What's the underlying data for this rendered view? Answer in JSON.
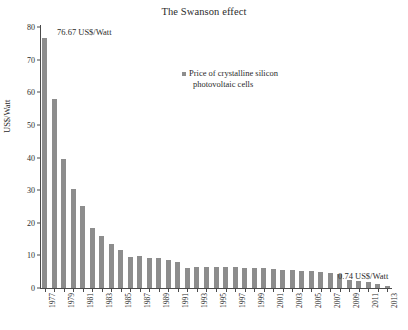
{
  "chart_data": {
    "type": "bar",
    "title": "The Swanson effect",
    "xlabel": "",
    "ylabel": "US$/Watt",
    "ylim": [
      0,
      80
    ],
    "ytick_step": 10,
    "yticks": [
      0,
      10,
      20,
      30,
      40,
      50,
      60,
      70,
      80
    ],
    "grid": false,
    "legend_position": "upper-center",
    "series_name": "Price of crystalline silicon photovoltaic cells",
    "legend_line_1": "Price of crystalline silicon",
    "legend_line_2": "photovoltaic cells",
    "bar_color": "#8d8d8d",
    "axis_color": "#4a4a4a",
    "categories": [
      "1977",
      "1978",
      "1979",
      "1980",
      "1981",
      "1982",
      "1983",
      "1984",
      "1985",
      "1986",
      "1987",
      "1988",
      "1989",
      "1990",
      "1991",
      "1992",
      "1993",
      "1994",
      "1995",
      "1996",
      "1997",
      "1998",
      "1999",
      "2000",
      "2001",
      "2002",
      "2003",
      "2004",
      "2005",
      "2006",
      "2007",
      "2008",
      "2009",
      "2010",
      "2011",
      "2012",
      "2013"
    ],
    "tick_labels": [
      "1977",
      "",
      "1979",
      "",
      "1981",
      "",
      "1983",
      "",
      "1985",
      "",
      "1987",
      "",
      "1989",
      "",
      "1991",
      "",
      "1993",
      "",
      "1995",
      "",
      "1997",
      "",
      "1999",
      "",
      "2001",
      "",
      "2003",
      "",
      "2005",
      "",
      "2007",
      "",
      "2009",
      "",
      "2011",
      "",
      "2013"
    ],
    "values": [
      76.67,
      58.0,
      39.5,
      30.5,
      25.0,
      18.5,
      16.0,
      13.5,
      11.5,
      9.5,
      9.7,
      9.2,
      9.1,
      8.5,
      7.9,
      6.1,
      6.3,
      6.3,
      6.5,
      6.4,
      6.3,
      6.2,
      6.0,
      6.0,
      5.9,
      5.6,
      5.4,
      5.2,
      5.1,
      5.0,
      4.6,
      4.3,
      2.4,
      2.1,
      1.7,
      1.1,
      0.74
    ],
    "annotations": [
      {
        "text": "76.67 US$/Watt",
        "at": "1977"
      },
      {
        "text": "0.74 US$/Watt",
        "at": "2013"
      }
    ]
  }
}
